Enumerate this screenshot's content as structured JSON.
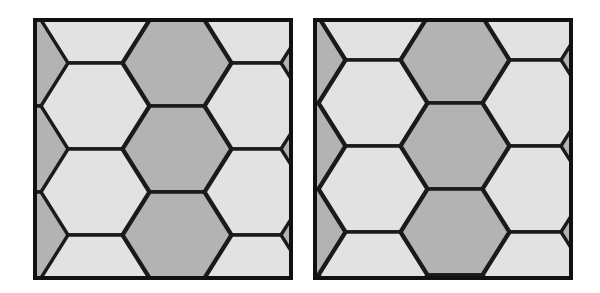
{
  "figure": {
    "title": "",
    "caption": "",
    "background_color": "#ffffff",
    "width": 600,
    "height": 293
  },
  "palette": {
    "dark_tile": "#b3b3b3",
    "light_tile": "#e2e2e2",
    "edge_stroke": "#1a1a1a",
    "frame_stroke": "#111111",
    "background": "#ffffff"
  },
  "panels": [
    {
      "id": "panel-left",
      "label": "left-tiling",
      "description": "Hexagonal tiling of elongated flat-topped hexagons arranged in straight vertical columns, two-tone shading",
      "frame": {
        "x": 5,
        "y": 5,
        "width": 256,
        "height": 258,
        "stroke_width": 4
      },
      "lattice": {
        "type": "hexagon",
        "orientation": "pointy-left-right",
        "column_pitch": 108,
        "row_pitch": 86,
        "column_offset_y": 43,
        "hexagon_half_width": 54,
        "hexagon_flat_half_width": 27,
        "hexagon_half_height": 43
      },
      "tile_count": 18,
      "dark_tile_count": 10,
      "light_tile_count": 8
    },
    {
      "id": "panel-right",
      "label": "right-tiling",
      "description": "Same hexagonal tiling sheared so that columns step diagonally downward to the left, two-tone shading",
      "frame": {
        "x": 5,
        "y": 5,
        "width": 256,
        "height": 258,
        "stroke_width": 4
      },
      "lattice": {
        "type": "hexagon",
        "orientation": "pointy-left-right",
        "column_pitch": 108,
        "row_pitch": 86,
        "column_offset_y": 100,
        "hexagon_half_width": 54,
        "hexagon_flat_half_width": 27,
        "hexagon_half_height": 43,
        "shear": "each column shifted down by ~100px relative to its left neighbour"
      },
      "tile_count": 18,
      "dark_tile_count": 11,
      "light_tile_count": 7
    }
  ],
  "panel_left_tiles": [
    {
      "cx": -20,
      "cy": -43,
      "shade": "dark"
    },
    {
      "cx": -20,
      "cy": 43,
      "shade": "dark"
    },
    {
      "cx": -20,
      "cy": 129,
      "shade": "dark"
    },
    {
      "cx": -20,
      "cy": 215,
      "shade": "dark"
    },
    {
      "cx": -20,
      "cy": 301,
      "shade": "dark"
    },
    {
      "cx": 60,
      "cy": 0,
      "shade": "light"
    },
    {
      "cx": 60,
      "cy": 86,
      "shade": "light"
    },
    {
      "cx": 60,
      "cy": 172,
      "shade": "light"
    },
    {
      "cx": 60,
      "cy": 258,
      "shade": "light"
    },
    {
      "cx": 142,
      "cy": -43,
      "shade": "dark"
    },
    {
      "cx": 142,
      "cy": 43,
      "shade": "dark"
    },
    {
      "cx": 142,
      "cy": 129,
      "shade": "dark"
    },
    {
      "cx": 142,
      "cy": 215,
      "shade": "dark"
    },
    {
      "cx": 142,
      "cy": 301,
      "shade": "dark"
    },
    {
      "cx": 224,
      "cy": 0,
      "shade": "light"
    },
    {
      "cx": 224,
      "cy": 86,
      "shade": "light"
    },
    {
      "cx": 224,
      "cy": 172,
      "shade": "light"
    },
    {
      "cx": 224,
      "cy": 258,
      "shade": "light"
    },
    {
      "cx": 300,
      "cy": -43,
      "shade": "dark"
    },
    {
      "cx": 300,
      "cy": 43,
      "shade": "dark"
    },
    {
      "cx": 300,
      "cy": 129,
      "shade": "dark"
    },
    {
      "cx": 300,
      "cy": 215,
      "shade": "dark"
    }
  ],
  "panel_right_tiles": [
    {
      "cx": -24,
      "cy": -46,
      "shade": "dark"
    },
    {
      "cx": -24,
      "cy": 40,
      "shade": "dark"
    },
    {
      "cx": -24,
      "cy": 126,
      "shade": "dark"
    },
    {
      "cx": -24,
      "cy": 212,
      "shade": "dark"
    },
    {
      "cx": -24,
      "cy": 298,
      "shade": "dark"
    },
    {
      "cx": 58,
      "cy": -89,
      "shade": "light"
    },
    {
      "cx": 58,
      "cy": -3,
      "shade": "light"
    },
    {
      "cx": 58,
      "cy": 83,
      "shade": "light"
    },
    {
      "cx": 58,
      "cy": 169,
      "shade": "light"
    },
    {
      "cx": 58,
      "cy": 255,
      "shade": "light"
    },
    {
      "cx": 140,
      "cy": -46,
      "shade": "dark"
    },
    {
      "cx": 140,
      "cy": 40,
      "shade": "dark"
    },
    {
      "cx": 140,
      "cy": 126,
      "shade": "dark"
    },
    {
      "cx": 140,
      "cy": 212,
      "shade": "dark"
    },
    {
      "cx": 140,
      "cy": 298,
      "shade": "dark"
    },
    {
      "cx": 222,
      "cy": -89,
      "shade": "light"
    },
    {
      "cx": 222,
      "cy": -3,
      "shade": "light"
    },
    {
      "cx": 222,
      "cy": 83,
      "shade": "light"
    },
    {
      "cx": 222,
      "cy": 169,
      "shade": "light"
    },
    {
      "cx": 222,
      "cy": 255,
      "shade": "light"
    },
    {
      "cx": 300,
      "cy": -46,
      "shade": "dark"
    },
    {
      "cx": 300,
      "cy": 40,
      "shade": "dark"
    },
    {
      "cx": 300,
      "cy": 126,
      "shade": "dark"
    },
    {
      "cx": 300,
      "cy": 212,
      "shade": "dark"
    }
  ]
}
